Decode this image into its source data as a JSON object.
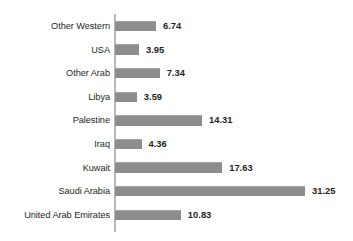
{
  "chart_data": {
    "type": "bar",
    "orientation": "horizontal",
    "title": "",
    "subtitle": "",
    "xlabel": "",
    "ylabel": "",
    "grid": false,
    "legend": false,
    "axis_line": true,
    "xlim": [
      0,
      31.25
    ],
    "categories": [
      "Other Western",
      "USA",
      "Other Arab",
      "Libya",
      "Palestine",
      "Iraq",
      "Kuwait",
      "Saudi Arabia",
      "United Arab Emirates"
    ],
    "values": [
      6.74,
      3.95,
      7.34,
      3.59,
      14.31,
      4.36,
      17.63,
      31.25,
      10.83
    ],
    "value_labels": [
      "6.74",
      "3.95",
      "7.34",
      "3.59",
      "14.31",
      "4.36",
      "17.63",
      "31.25",
      "10.83"
    ],
    "colors": {
      "bar_fill": "#8d8d8d",
      "bar_top_edge": "#a6a6a6",
      "axis_line": "#b9b9b9",
      "text": "#231f20",
      "background": "#ffffff"
    }
  }
}
